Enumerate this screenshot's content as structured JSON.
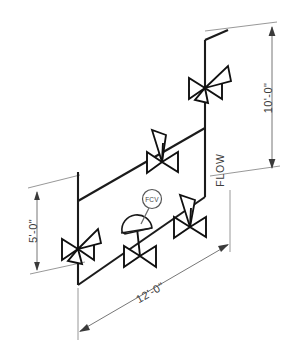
{
  "drawing": {
    "title": "Isometric Piping Diagram",
    "type": "piping-isometric",
    "background_color": "#ffffff",
    "line_color": "#1b1b1b",
    "dimension_color": "#777777",
    "instrument_color": "#555555"
  },
  "dimensions": [
    {
      "id": "vertical-right",
      "label": "10'-0\"",
      "orientation": "vertical",
      "position": "right",
      "measures": "riser-height"
    },
    {
      "id": "vertical-left",
      "label": "5'-0\"",
      "orientation": "vertical",
      "position": "left",
      "measures": "drop-height"
    },
    {
      "id": "horizontal-bottom",
      "label": "12'-0\"",
      "orientation": "isometric-diagonal",
      "position": "bottom",
      "measures": "run-length"
    }
  ],
  "annotations": {
    "flow_label": "FLOW",
    "flow_direction": "downward-on-right-riser"
  },
  "instruments": [
    {
      "id": "fcv-bubble",
      "tag": "FCV",
      "shape": "circle-balloon",
      "attached_to": "control-valve"
    }
  ],
  "valves": [
    {
      "id": "valve-top-riser",
      "type": "butterfly-valve",
      "operator": "hand-lever",
      "location": "top of right riser"
    },
    {
      "id": "valve-upper-run",
      "type": "butterfly-valve",
      "operator": "hand-lever",
      "location": "upper horizontal run, middle"
    },
    {
      "id": "valve-lower-run-right",
      "type": "butterfly-valve",
      "operator": "hand-lever",
      "location": "lower horizontal run, right"
    },
    {
      "id": "valve-left-drop",
      "type": "butterfly-valve",
      "operator": "hand-lever",
      "location": "left vertical drop"
    },
    {
      "id": "control-valve",
      "type": "control-valve",
      "operator": "diaphragm-actuator",
      "tag": "FCV",
      "location": "lower horizontal run, middle"
    }
  ]
}
